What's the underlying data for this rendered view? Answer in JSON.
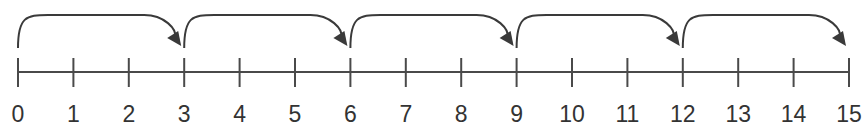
{
  "diagram": {
    "type": "number-line-skip-counting",
    "start": 0,
    "end": 15,
    "step": 1,
    "jump_size": 3,
    "ticks": [
      "0",
      "1",
      "2",
      "3",
      "4",
      "5",
      "6",
      "7",
      "8",
      "9",
      "10",
      "11",
      "12",
      "13",
      "14",
      "15"
    ],
    "jumps": [
      {
        "from": 0,
        "to": 3
      },
      {
        "from": 3,
        "to": 6
      },
      {
        "from": 6,
        "to": 9
      },
      {
        "from": 9,
        "to": 12
      },
      {
        "from": 12,
        "to": 15
      }
    ],
    "colors": {
      "line": "#4a4a4a",
      "arrow": "#3a3a3a",
      "label": "#333333",
      "background": "#ffffff"
    }
  }
}
